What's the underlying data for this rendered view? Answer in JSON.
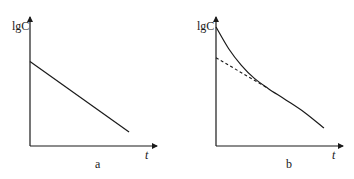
{
  "chart_data": [
    {
      "type": "line",
      "panel": "a",
      "caption": "a",
      "title": "",
      "xlabel": "t",
      "ylabel": "lgC",
      "grid": false,
      "legend": null,
      "series": [
        {
          "name": "lgC vs t (linear decline)",
          "style": "solid",
          "x": [
            0,
            0.78
          ],
          "y": [
            0.66,
            0.11
          ]
        }
      ],
      "xlim": [
        0,
        1
      ],
      "ylim": [
        0,
        1
      ],
      "tick_labels": false
    },
    {
      "type": "line",
      "panel": "b",
      "caption": "b",
      "title": "",
      "xlabel": "t",
      "ylabel": "lgC",
      "grid": false,
      "legend": null,
      "series": [
        {
          "name": "lgC vs t (curved, biexponential decline)",
          "style": "solid",
          "x": [
            0,
            0.1,
            0.2,
            0.3,
            0.41,
            0.55,
            0.7,
            0.85
          ],
          "y": [
            0.93,
            0.76,
            0.63,
            0.53,
            0.45,
            0.36,
            0.26,
            0.14
          ]
        },
        {
          "name": "back-extrapolated terminal phase",
          "style": "dashed",
          "x": [
            0,
            0.41
          ],
          "y": [
            0.69,
            0.45
          ]
        }
      ],
      "xlim": [
        0,
        1
      ],
      "ylim": [
        0,
        1
      ],
      "tick_labels": false
    }
  ],
  "labels": {
    "a": {
      "ylabel": "lgC",
      "xlabel": "t",
      "caption": "a"
    },
    "b": {
      "ylabel": "lgC",
      "xlabel": "t",
      "caption": "b"
    }
  },
  "colors": {
    "line": "#1a1a1a",
    "background": "#ffffff"
  }
}
